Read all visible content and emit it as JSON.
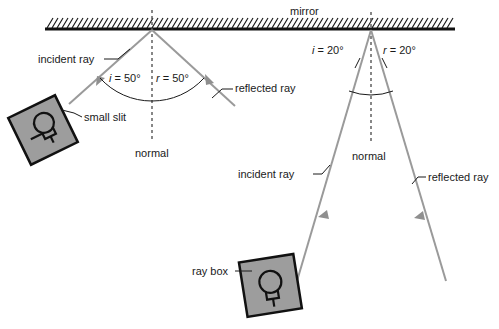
{
  "figure": {
    "mirror_label": "mirror"
  },
  "colors": {
    "ray": "#9a9a9a",
    "box_fill": "#9d9d9d",
    "ink": "#1a1a1a",
    "normal": "#555555",
    "background": "#ffffff"
  },
  "left_setup": {
    "incident_ray_label": "incident ray",
    "reflected_ray_label": "reflected ray",
    "normal_label": "normal",
    "slit_label": "small slit",
    "angle_of_incidence": "i = 50°",
    "angle_of_reflection": "r = 50°",
    "incidence_symbol": "i",
    "reflection_symbol": "r",
    "incidence_value": "= 50°",
    "reflection_value": "= 50°"
  },
  "right_setup": {
    "incident_ray_label": "incident ray",
    "reflected_ray_label": "reflected ray",
    "normal_label": "normal",
    "ray_box_label": "ray box",
    "angle_of_incidence": "i = 20°",
    "angle_of_reflection": "r = 20°",
    "incidence_symbol": "i",
    "reflection_symbol": "r",
    "incidence_value": "= 20°",
    "reflection_value": "= 20°"
  },
  "icons": {
    "ray_box_left": "ray-box-lamp-icon",
    "ray_box_right": "ray-box-lamp-icon",
    "mirror_hatching": "mirror-hatch-icon"
  }
}
